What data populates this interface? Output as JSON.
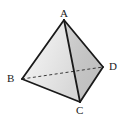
{
  "figure": {
    "name": "tetrahedron",
    "background_color": "#ffffff",
    "stroke_color": "#1a1a1a",
    "labels": {
      "apex": "A",
      "left": "B",
      "front": "C",
      "right": "D"
    },
    "vertices": {
      "A": {
        "x": 64,
        "y": 20
      },
      "B": {
        "x": 22,
        "y": 79
      },
      "C": {
        "x": 80,
        "y": 102
      },
      "D": {
        "x": 103,
        "y": 67
      }
    },
    "edges": [
      {
        "name": "AB",
        "from": "A",
        "to": "B",
        "style": "solid"
      },
      {
        "name": "AC",
        "from": "A",
        "to": "C",
        "style": "solid"
      },
      {
        "name": "AD",
        "from": "A",
        "to": "D",
        "style": "solid"
      },
      {
        "name": "BC",
        "from": "B",
        "to": "C",
        "style": "solid"
      },
      {
        "name": "CD",
        "from": "C",
        "to": "D",
        "style": "solid"
      },
      {
        "name": "BD",
        "from": "B",
        "to": "D",
        "style": "dashed"
      }
    ],
    "faces": [
      {
        "name": "ABC",
        "fill": "#e8e8e8"
      },
      {
        "name": "ACD",
        "fill": "#c9c9c9"
      },
      {
        "name": "ABD",
        "fill": "#f2f2f2"
      }
    ]
  }
}
